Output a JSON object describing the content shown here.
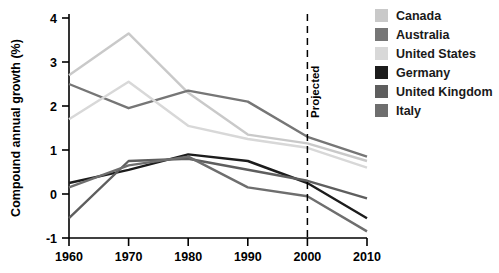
{
  "chart_data": {
    "type": "line",
    "title": "",
    "xlabel": "",
    "ylabel": "Compound annual growth (%)",
    "x": [
      1960,
      1970,
      1980,
      1990,
      2000,
      2010
    ],
    "xtick_labels": [
      "1960",
      "1970",
      "1980",
      "1990",
      "2000",
      "2010"
    ],
    "ytick_labels": [
      "-1",
      "0",
      "1",
      "2",
      "3",
      "4"
    ],
    "yticks": [
      -1,
      0,
      1,
      2,
      3,
      4
    ],
    "ylim": [
      -1,
      4
    ],
    "xlim": [
      1960,
      2010
    ],
    "grid": false,
    "legend_position": "right",
    "annotations": [
      {
        "text": "Projected",
        "x": 2000,
        "orientation": "vertical",
        "marker": "dashed-vertical-line"
      }
    ],
    "series": [
      {
        "name": "Canada",
        "color": "#c9c9c9",
        "values": [
          2.7,
          3.65,
          2.3,
          1.35,
          1.15,
          0.75
        ]
      },
      {
        "name": "Australia",
        "color": "#767676",
        "values": [
          2.5,
          1.95,
          2.35,
          2.1,
          1.3,
          0.85
        ]
      },
      {
        "name": "United States",
        "color": "#d8d8d8",
        "values": [
          1.7,
          2.55,
          1.55,
          1.25,
          1.05,
          0.6
        ]
      },
      {
        "name": "Germany",
        "color": "#1c1c1c",
        "values": [
          0.25,
          0.55,
          0.9,
          0.75,
          0.25,
          -0.55
        ]
      },
      {
        "name": "United Kingdom",
        "color": "#5e5e5e",
        "values": [
          -0.55,
          0.75,
          0.8,
          0.55,
          0.3,
          -0.1
        ]
      },
      {
        "name": "Italy",
        "color": "#6e6e6e",
        "values": [
          0.15,
          0.65,
          0.85,
          0.15,
          -0.05,
          -0.85
        ]
      }
    ]
  },
  "legend": {
    "items": [
      {
        "label": "Canada",
        "color": "#c9c9c9"
      },
      {
        "label": "Australia",
        "color": "#767676"
      },
      {
        "label": "United States",
        "color": "#d8d8d8"
      },
      {
        "label": "Germany",
        "color": "#1c1c1c"
      },
      {
        "label": "United Kingdom",
        "color": "#5e5e5e"
      },
      {
        "label": "Italy",
        "color": "#6e6e6e"
      }
    ]
  }
}
